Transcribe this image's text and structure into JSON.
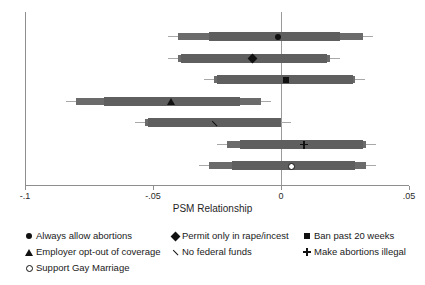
{
  "chart_data": {
    "type": "scatter",
    "title": "",
    "xlabel": "PSM Relationship",
    "ylabel": "",
    "xlim": [
      -0.1,
      0.05
    ],
    "xticks": [
      -0.1,
      -0.05,
      0,
      0.05
    ],
    "xticklabels": [
      "-.1",
      "-.05",
      "0",
      ".05"
    ],
    "grid": false,
    "zero_reference_line": 0,
    "legend_position": "below-plot",
    "series": [
      {
        "name": "Always allow abortions",
        "marker": "filled-circle",
        "estimate": -0.001,
        "ci95": [
          -0.044,
          0.036
        ],
        "ci90": [
          -0.028,
          0.023
        ]
      },
      {
        "name": "Permit only in rape/incest",
        "marker": "filled-diamond",
        "estimate": -0.011,
        "ci95": [
          -0.044,
          0.023
        ],
        "ci90": [
          -0.039,
          0.018
        ]
      },
      {
        "name": "Ban past 20 weeks",
        "marker": "filled-square",
        "estimate": 0.002,
        "ci95": [
          -0.03,
          0.033
        ],
        "ci90": [
          -0.025,
          0.028
        ]
      },
      {
        "name": "Employer opt-out of coverage",
        "marker": "filled-triangle",
        "estimate": -0.043,
        "ci95": [
          -0.084,
          -0.004
        ],
        "ci90": [
          -0.069,
          -0.016
        ]
      },
      {
        "name": "No federal funds",
        "marker": "cross",
        "estimate": -0.026,
        "ci95": [
          -0.057,
          0.004
        ],
        "ci90": [
          -0.052,
          0.0
        ]
      },
      {
        "name": "Make abortions illegal",
        "marker": "plus",
        "estimate": 0.009,
        "ci95": [
          -0.025,
          0.037
        ],
        "ci90": [
          -0.016,
          0.032
        ]
      },
      {
        "name": "Support Gay Marriage",
        "marker": "open-circle",
        "estimate": 0.004,
        "ci95": [
          -0.032,
          0.037
        ],
        "ci90": [
          -0.019,
          0.029
        ]
      }
    ]
  },
  "axis": {
    "xlabel": "PSM Relationship",
    "ticklabels": [
      "-.1",
      "-.05",
      "0",
      ".05"
    ]
  },
  "legend": {
    "columns": [
      [
        {
          "label": "Always allow abortions",
          "marker": "filled-circle"
        },
        {
          "label": "Employer opt-out of coverage",
          "marker": "filled-triangle"
        },
        {
          "label": "Support Gay Marriage",
          "marker": "open-circle"
        }
      ],
      [
        {
          "label": "Permit only in rape/incest",
          "marker": "filled-diamond"
        },
        {
          "label": "No federal funds",
          "marker": "cross"
        }
      ],
      [
        {
          "label": "Ban past 20 weeks",
          "marker": "filled-square"
        },
        {
          "label": "Make abortions illegal",
          "marker": "plus"
        }
      ]
    ]
  },
  "colors": {
    "band": "#5f6060",
    "whisker": "#a8a8a8",
    "marker": "#111111",
    "axis": "#8e8e8e",
    "background": "#ffffff"
  }
}
